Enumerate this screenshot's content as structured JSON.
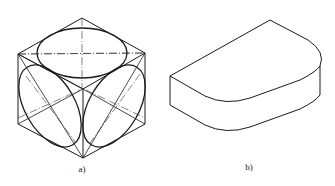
{
  "figures": [
    {
      "id": "a",
      "label": "a)",
      "description": "Isometric cube with inscribed ellipses (isometric circles) on three visible faces, with center lines"
    },
    {
      "id": "b",
      "label": "b)",
      "description": "Isometric view of a slab with one rounded end"
    }
  ],
  "colors": {
    "stroke": "#1a1a1a",
    "centerline": "#333333",
    "background": "#ffffff"
  }
}
